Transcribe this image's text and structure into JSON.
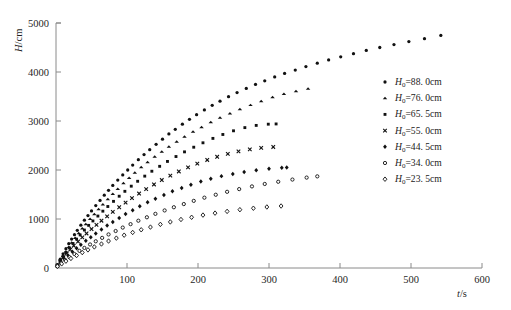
{
  "chart_data": {
    "type": "scatter",
    "title": "",
    "xlabel": "t/s",
    "ylabel": "H/cm",
    "xlim": [
      0,
      600
    ],
    "ylim": [
      0,
      5000
    ],
    "xticks": [
      0,
      100,
      200,
      300,
      400,
      500,
      600
    ],
    "yticks": [
      0,
      1000,
      2000,
      3000,
      4000,
      5000
    ],
    "xtick_labels": [
      "0",
      "100",
      "200",
      "300",
      "400",
      "500",
      "600"
    ],
    "ytick_labels": [
      "0",
      "1000",
      "2000",
      "3000",
      "4000",
      "5000"
    ],
    "grid": false,
    "legend_position": "right",
    "series": [
      {
        "name": "H_0=88. 0cm",
        "label_prefix": "H",
        "label_subscript": "0",
        "label_value": "=88. 0cm",
        "marker": "filled-circle",
        "color": "#111111",
        "x": [
          2,
          6,
          10,
          14,
          18,
          22,
          26,
          30,
          35,
          40,
          45,
          50,
          56,
          62,
          68,
          74,
          80,
          87,
          94,
          101,
          108,
          116,
          124,
          132,
          141,
          150,
          159,
          168,
          178,
          188,
          198,
          209,
          220,
          231,
          243,
          255,
          268,
          281,
          294,
          308,
          322,
          337,
          352,
          368,
          384,
          401,
          419,
          437,
          456,
          476,
          497,
          519,
          542
        ],
        "y": [
          70,
          180,
          290,
          395,
          495,
          590,
          680,
          770,
          875,
          975,
          1070,
          1165,
          1275,
          1380,
          1485,
          1585,
          1685,
          1795,
          1900,
          2000,
          2100,
          2210,
          2315,
          2415,
          2525,
          2630,
          2735,
          2830,
          2935,
          3035,
          3130,
          3225,
          3320,
          3405,
          3495,
          3580,
          3665,
          3745,
          3820,
          3900,
          3970,
          4040,
          4110,
          4180,
          4245,
          4310,
          4375,
          4440,
          4500,
          4560,
          4620,
          4680,
          4745
        ]
      },
      {
        "name": "H_0=76. 0cm",
        "label_prefix": "H",
        "label_subscript": "0",
        "label_value": "=76. 0cm",
        "marker": "filled-triangle",
        "color": "#111111",
        "x": [
          2,
          6,
          10,
          14,
          18,
          22,
          27,
          32,
          37,
          42,
          48,
          54,
          60,
          66,
          73,
          80,
          87,
          95,
          103,
          111,
          120,
          129,
          139,
          149,
          159,
          170,
          181,
          193,
          205,
          218,
          231,
          245,
          259,
          274,
          289,
          305,
          321,
          338,
          355
        ],
        "y": [
          60,
          155,
          250,
          340,
          430,
          515,
          615,
          710,
          805,
          895,
          1000,
          1100,
          1200,
          1295,
          1405,
          1510,
          1615,
          1730,
          1840,
          1945,
          2055,
          2160,
          2270,
          2375,
          2475,
          2580,
          2680,
          2780,
          2875,
          2975,
          3065,
          3155,
          3240,
          3325,
          3405,
          3485,
          3550,
          3610,
          3660
        ]
      },
      {
        "name": "H_0=65. 5cm",
        "label_prefix": "H",
        "label_subscript": "0",
        "label_value": "=65. 5cm",
        "marker": "filled-square",
        "color": "#111111",
        "x": [
          2,
          6,
          10,
          14,
          19,
          24,
          29,
          34,
          40,
          46,
          52,
          59,
          66,
          73,
          81,
          89,
          97,
          106,
          115,
          125,
          135,
          146,
          157,
          169,
          181,
          194,
          207,
          221,
          235,
          250,
          266,
          282,
          299,
          310
        ],
        "y": [
          55,
          145,
          230,
          315,
          410,
          500,
          590,
          675,
          775,
          870,
          960,
          1060,
          1160,
          1255,
          1360,
          1465,
          1565,
          1670,
          1770,
          1875,
          1975,
          2075,
          2175,
          2275,
          2370,
          2465,
          2555,
          2645,
          2725,
          2800,
          2865,
          2910,
          2935,
          2940
        ]
      },
      {
        "name": "H_0=55. 0cm",
        "label_prefix": "H",
        "label_subscript": "0",
        "label_value": "=55. 0cm",
        "marker": "cross-x",
        "color": "#111111",
        "x": [
          2,
          6,
          10,
          15,
          20,
          25,
          31,
          37,
          43,
          50,
          57,
          64,
          72,
          80,
          89,
          98,
          107,
          117,
          127,
          138,
          149,
          161,
          173,
          186,
          199,
          213,
          227,
          242,
          257,
          273,
          289,
          306
        ],
        "y": [
          50,
          130,
          210,
          295,
          375,
          455,
          540,
          625,
          705,
          795,
          880,
          965,
          1055,
          1145,
          1240,
          1335,
          1425,
          1520,
          1610,
          1705,
          1795,
          1885,
          1970,
          2055,
          2130,
          2205,
          2270,
          2330,
          2380,
          2420,
          2450,
          2470
        ]
      },
      {
        "name": "H_0=44. 5cm",
        "label_prefix": "H",
        "label_subscript": "0",
        "label_value": "=44. 5cm",
        "marker": "filled-diamond",
        "color": "#111111",
        "x": [
          2,
          7,
          12,
          17,
          23,
          29,
          35,
          42,
          49,
          56,
          64,
          72,
          80,
          89,
          98,
          108,
          118,
          129,
          140,
          152,
          164,
          177,
          190,
          204,
          218,
          233,
          249,
          265,
          282,
          300,
          318,
          325
        ],
        "y": [
          45,
          115,
          185,
          255,
          330,
          405,
          475,
          555,
          630,
          705,
          785,
          865,
          940,
          1020,
          1100,
          1180,
          1260,
          1340,
          1415,
          1490,
          1565,
          1635,
          1700,
          1765,
          1820,
          1875,
          1920,
          1960,
          1995,
          2025,
          2045,
          2050
        ]
      },
      {
        "name": "H_0=34. 0cm",
        "label_prefix": "H",
        "label_subscript": "0",
        "label_value": "=34. 0cm",
        "marker": "open-circle",
        "color": "#111111",
        "x": [
          2,
          7,
          13,
          19,
          26,
          33,
          40,
          48,
          56,
          65,
          74,
          84,
          94,
          105,
          116,
          128,
          140,
          153,
          166,
          180,
          194,
          209,
          225,
          241,
          258,
          276,
          294,
          313,
          333,
          353,
          368
        ],
        "y": [
          40,
          100,
          160,
          220,
          285,
          350,
          410,
          480,
          545,
          615,
          685,
          755,
          825,
          895,
          965,
          1035,
          1105,
          1175,
          1240,
          1305,
          1370,
          1435,
          1495,
          1555,
          1610,
          1665,
          1715,
          1760,
          1805,
          1845,
          1870
        ]
      },
      {
        "name": "H_0=23. 5cm",
        "label_prefix": "H",
        "label_subscript": "0",
        "label_value": "=23. 5cm",
        "marker": "open-diamond",
        "color": "#111111",
        "x": [
          2,
          8,
          14,
          21,
          29,
          37,
          45,
          54,
          64,
          74,
          85,
          96,
          108,
          120,
          133,
          147,
          161,
          176,
          191,
          207,
          224,
          241,
          259,
          278,
          297,
          317
        ],
        "y": [
          35,
          85,
          140,
          195,
          255,
          315,
          370,
          430,
          490,
          550,
          610,
          670,
          725,
          780,
          835,
          890,
          940,
          990,
          1035,
          1080,
          1120,
          1155,
          1190,
          1220,
          1245,
          1265
        ]
      }
    ]
  }
}
